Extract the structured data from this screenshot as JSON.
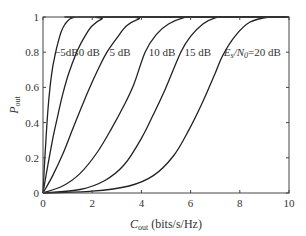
{
  "chart_data": {
    "type": "line",
    "title": "",
    "xlabel": "C_out (bits/s/Hz)",
    "xlabel_main": "C",
    "xlabel_sub": "out",
    "xlabel_unit": " (bits/s/Hz)",
    "ylabel": "P_out",
    "ylabel_main": "P",
    "ylabel_sub": "out",
    "xlim": [
      0,
      10
    ],
    "ylim": [
      0,
      1
    ],
    "xticks": [
      0,
      2,
      4,
      6,
      8,
      10
    ],
    "yticks": [
      0,
      0.2,
      0.4,
      0.6,
      0.8,
      1
    ],
    "xtick_labels": [
      "0",
      "2",
      "4",
      "6",
      "8",
      "10"
    ],
    "ytick_labels": [
      "0",
      "0.2",
      "0.4",
      "0.6",
      "0.8",
      "1"
    ],
    "grid": false,
    "legend": "inline annotations near y=0.8",
    "series": [
      {
        "name": "-5 dB",
        "label": "−5dB",
        "x": [
          0,
          0.1,
          0.2,
          0.3,
          0.4,
          0.5,
          0.6,
          0.75,
          0.9,
          1.1,
          1.3,
          1.6
        ],
        "y": [
          0,
          0.26,
          0.47,
          0.62,
          0.72,
          0.79,
          0.85,
          0.92,
          0.96,
          0.99,
          1.0,
          1.0
        ]
      },
      {
        "name": "0 dB",
        "label": "0 dB",
        "x": [
          0,
          0.2,
          0.4,
          0.6,
          0.8,
          1.0,
          1.2,
          1.4,
          1.7,
          2.0,
          2.4,
          2.8
        ],
        "y": [
          0,
          0.16,
          0.31,
          0.44,
          0.56,
          0.66,
          0.74,
          0.81,
          0.89,
          0.95,
          0.99,
          1.0
        ]
      },
      {
        "name": "5 dB",
        "label": "5 dB",
        "x": [
          0,
          0.4,
          0.8,
          1.2,
          1.6,
          2.0,
          2.3,
          2.6,
          3.0,
          3.4,
          3.9,
          4.3
        ],
        "y": [
          0,
          0.1,
          0.22,
          0.36,
          0.5,
          0.63,
          0.72,
          0.8,
          0.88,
          0.95,
          0.99,
          1.0
        ]
      },
      {
        "name": "10 dB",
        "label": "10 dB",
        "x": [
          0,
          0.8,
          1.5,
          2.2,
          2.8,
          3.3,
          3.7,
          4.15,
          4.6,
          5.1,
          5.7,
          6.2
        ],
        "y": [
          0,
          0.04,
          0.11,
          0.23,
          0.37,
          0.5,
          0.62,
          0.8,
          0.9,
          0.96,
          0.995,
          1.0
        ]
      },
      {
        "name": "15 dB",
        "label": "15 dB",
        "x": [
          0,
          1.5,
          2.5,
          3.3,
          4.0,
          4.5,
          5.0,
          5.6,
          6.0,
          6.5,
          7.0,
          7.5
        ],
        "y": [
          0,
          0.02,
          0.07,
          0.16,
          0.31,
          0.45,
          0.6,
          0.8,
          0.89,
          0.96,
          0.995,
          1.0
        ]
      },
      {
        "name": "Es/N0 = 20 dB",
        "label": "Es/N0=20 dB",
        "x": [
          0,
          2.0,
          3.5,
          4.5,
          5.3,
          5.9,
          6.5,
          7.0,
          7.3,
          7.8,
          8.4,
          9.2
        ],
        "y": [
          0,
          0.01,
          0.04,
          0.1,
          0.21,
          0.35,
          0.52,
          0.68,
          0.78,
          0.89,
          0.97,
          1.0
        ]
      }
    ],
    "annotations": [
      {
        "text": "−5dB",
        "x": 0.45,
        "y": 0.8
      },
      {
        "text": "0 dB",
        "x": 1.45,
        "y": 0.8
      },
      {
        "text": "5 dB",
        "x": 2.7,
        "y": 0.8
      },
      {
        "text": "10 dB",
        "x": 4.3,
        "y": 0.8
      },
      {
        "text": "15 dB",
        "x": 5.75,
        "y": 0.8
      },
      {
        "text_main": "E",
        "text_sub": "s",
        "text_mid": "/N",
        "text_sub2": "0",
        "text_tail": "=20 dB",
        "x": 7.35,
        "y": 0.8
      }
    ]
  }
}
